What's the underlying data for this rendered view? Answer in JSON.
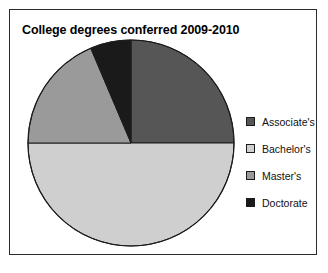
{
  "chart_data": {
    "type": "pie",
    "title": "College degrees conferred 2009-2010",
    "categories": [
      "Associate's",
      "Bachelor's",
      "Master's",
      "Doctorate"
    ],
    "values": [
      25,
      50,
      19,
      6
    ],
    "units": "percent",
    "start_angle_deg": 0,
    "direction": "clockwise",
    "legend_position": "right",
    "grid": false,
    "xlabel": "",
    "ylabel": "",
    "colors": [
      "#565656",
      "#cfcfcf",
      "#9a9a9a",
      "#1a1a1a"
    ],
    "slice_border_color": "#1c1c1c",
    "slices": [
      {
        "label": "Associate's",
        "value": 25,
        "color": "#565656",
        "start_deg": 0,
        "end_deg": 90
      },
      {
        "label": "Bachelor's",
        "value": 50,
        "color": "#cfcfcf",
        "start_deg": 90,
        "end_deg": 270
      },
      {
        "label": "Master's",
        "value": 19,
        "color": "#9a9a9a",
        "start_deg": 270,
        "end_deg": 337
      },
      {
        "label": "Doctorate",
        "value": 6,
        "color": "#1a1a1a",
        "start_deg": 337,
        "end_deg": 360
      }
    ]
  },
  "chart": {
    "title": "College degrees conferred 2009-2010",
    "border_color": "#2b2b2b",
    "background": "#ffffff"
  },
  "legend": {
    "items": [
      {
        "label": "Associate's",
        "color": "#565656"
      },
      {
        "label": "Bachelor's",
        "color": "#cfcfcf"
      },
      {
        "label": "Master's",
        "color": "#9a9a9a"
      },
      {
        "label": "Doctorate",
        "color": "#1a1a1a"
      }
    ]
  }
}
